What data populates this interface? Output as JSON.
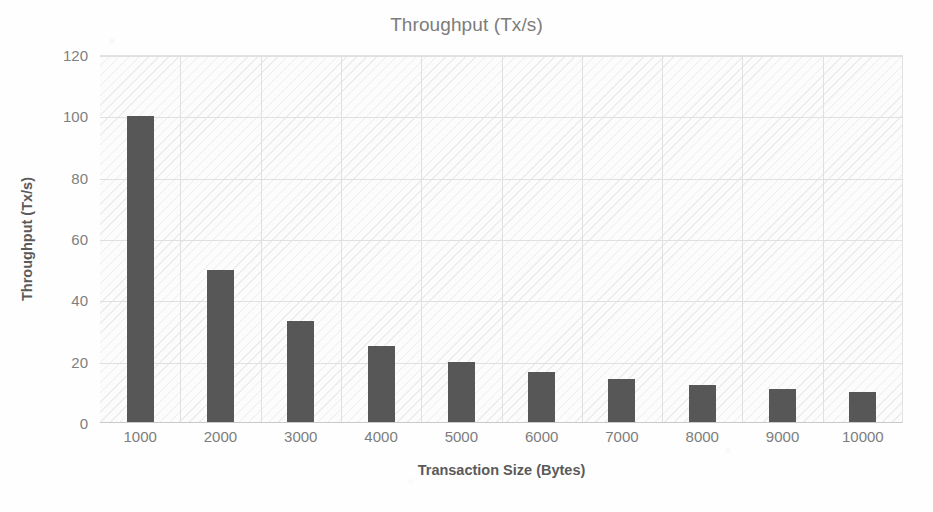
{
  "chart_data": {
    "type": "bar",
    "title": "Throughput (Tx/s)",
    "xlabel": "Transaction Size (Bytes)",
    "ylabel": "Throughput (Tx/s)",
    "categories": [
      "1000",
      "2000",
      "3000",
      "4000",
      "5000",
      "6000",
      "7000",
      "8000",
      "9000",
      "10000"
    ],
    "values": [
      100,
      50,
      33.3,
      25,
      20,
      16.7,
      14.3,
      12.5,
      11.1,
      10
    ],
    "ylim": [
      0,
      120
    ],
    "ytick_labels": [
      "0",
      "20",
      "40",
      "60",
      "80",
      "100",
      "120"
    ],
    "ytick_values": [
      0,
      20,
      40,
      60,
      80,
      100,
      120
    ],
    "grid": "both",
    "legend": "none",
    "series": [
      {
        "name": "Throughput",
        "values": [
          100,
          50,
          33.3,
          25,
          20,
          16.7,
          14.3,
          12.5,
          11.1,
          10
        ]
      }
    ]
  },
  "style": {
    "bar_color": "#575757",
    "grid_color": "#e0e0e0",
    "title_color": "#7c7c7c",
    "tick_color": "#7d7d7d",
    "axis_title_color": "#5a5a5a",
    "plot_background": "#fcfcfc"
  }
}
